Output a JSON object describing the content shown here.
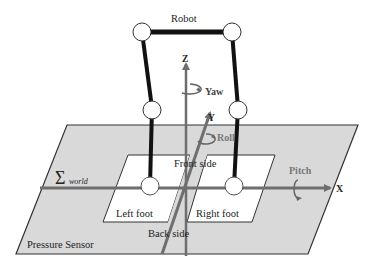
{
  "labels": {
    "robot": "Robot",
    "z_axis": "Z",
    "yaw": "Yaw",
    "y_axis": "Y",
    "roll": "Roll",
    "front_side": "Front side",
    "pitch": "Pitch",
    "x_axis": "X",
    "sigma": "Σ",
    "world_sub": "world",
    "left_foot": "Left foot",
    "right_foot": "Right foot",
    "back_side": "Back side",
    "pressure_sensor": "Pressure Sensor"
  },
  "colors": {
    "plane_fill": "#d9d9d9",
    "plane_stroke": "#333333",
    "foot_fill": "#ffffff",
    "axis": "#6e6e6e",
    "robot_link": "#111111",
    "joint_fill": "#ffffff",
    "joint_stroke": "#333333",
    "label_dark": "#222222",
    "label_gray": "#666666"
  }
}
